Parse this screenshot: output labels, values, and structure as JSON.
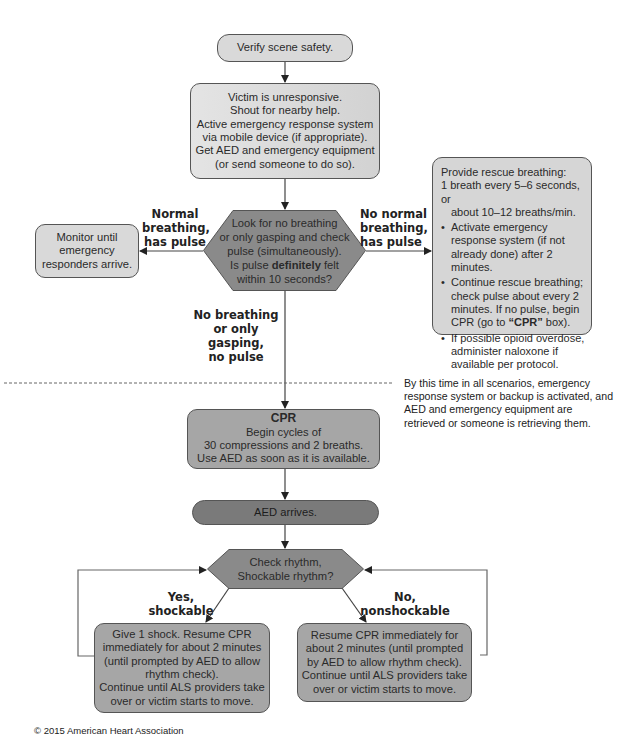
{
  "diagram": {
    "start": {
      "text": "Verify scene safety."
    },
    "assess": {
      "lines": [
        "Victim is unresponsive.",
        "Shout for nearby help.",
        "Active emergency response system",
        "via mobile device (if appropriate).",
        "Get AED and emergency equipment",
        "(or send someone to do so)."
      ]
    },
    "decision_pulse": {
      "line1": "Look for no breathing",
      "line2": "or only gasping and check",
      "line3": "pulse (simultaneously).",
      "line4_pre": "Is pulse ",
      "line4_bold": "definitely",
      "line4_post": " felt",
      "line5": "within 10 seconds?"
    },
    "branch_normal": {
      "label_lines": [
        "Normal",
        "breathing,",
        "has pulse"
      ],
      "box_lines": [
        "Monitor until",
        "emergency",
        "responders arrive."
      ]
    },
    "branch_no_normal": {
      "label_lines": [
        "No normal",
        "breathing,",
        "has pulse"
      ],
      "box": {
        "intro1": "Provide rescue breathing:",
        "intro2": "1 breath every 5–6 seconds, or",
        "intro3": "about 10–12 breaths/min.",
        "bullet1": "Activate emergency response system (if not already done) after 2 minutes.",
        "bullet2_pre": "Continue rescue breathing; check pulse about every 2 minutes. If no pulse, begin CPR (go to ",
        "bullet2_bold": "“CPR”",
        "bullet2_post": " box).",
        "bullet3": "If possible opioid overdose, administer naloxone if available per protocol."
      }
    },
    "branch_no_breathing": {
      "label_lines": [
        "No breathing",
        "or only gasping,",
        "no pulse"
      ]
    },
    "note": "By this time in all scenarios, emergency response system or backup is activated, and AED and emergency equipment are retrieved or someone is retrieving them.",
    "cpr": {
      "title": "CPR",
      "lines": [
        "Begin cycles of",
        "30 compressions and 2 breaths.",
        "Use AED as soon as it is available."
      ]
    },
    "aed": {
      "text": "AED arrives."
    },
    "decision_rhythm": {
      "line1": "Check rhythm,",
      "line2": "Shockable rhythm?"
    },
    "shockable": {
      "label_lines": [
        "Yes,",
        "shockable"
      ],
      "box_lines": [
        "Give 1 shock. Resume CPR",
        "immediately for about 2 minutes",
        "(until prompted by AED to allow",
        "rhythm check).",
        "Continue until ALS providers take",
        "over or victim starts to move."
      ]
    },
    "nonshockable": {
      "label_lines": [
        "No,",
        "nonshockable"
      ],
      "box_lines": [
        "Resume CPR immediately for",
        "about 2 minutes (until prompted",
        "by AED to allow rhythm check).",
        "Continue until ALS providers take",
        "over or victim starts to move."
      ]
    },
    "colors": {
      "light_box": "#d9d9d9",
      "mid_box": "#a6a6a6",
      "dark_box": "#7a7a7a",
      "decision": "#8a8a8a",
      "line": "#444444"
    }
  },
  "footer": {
    "copyright": "© 2015 American Heart Association"
  }
}
